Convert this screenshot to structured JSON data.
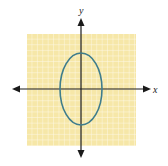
{
  "figure": {
    "type": "coordinate-plane-ellipse",
    "x_axis_label": "x",
    "y_axis_label": "y",
    "grid_color": "#f6e7a8",
    "grid_line_color": "#ffffff",
    "axis_color": "#1a1a1a",
    "curve_color": "#3f7d8c",
    "ellipse": {
      "orientation": "vertical",
      "center": [
        0,
        0
      ],
      "semi_axis_x": 4,
      "semi_axis_y": 7
    }
  }
}
